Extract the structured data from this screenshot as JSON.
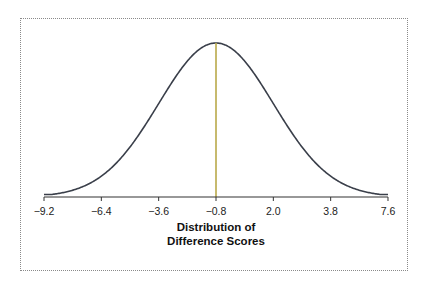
{
  "chart_data": {
    "type": "line",
    "title": "",
    "subtitle": "",
    "xlabel_line1": "Distribution of",
    "xlabel_line2": "Difference Scores",
    "ylabel": "",
    "x_ticks": [
      "−9.2",
      "−6.4",
      "−3.6",
      "−0.8",
      "2.0",
      "3.8",
      "7.6"
    ],
    "x_tick_values": [
      -9.2,
      -6.4,
      -3.6,
      -0.8,
      2.0,
      3.8,
      7.6
    ],
    "mean": -0.8,
    "mean_line_label": "-0.8",
    "sd_units": [
      -3,
      -2,
      -1,
      0,
      1,
      2,
      3
    ],
    "grid": false,
    "legend": "none",
    "series": [
      {
        "name": "Distribution of Difference Scores",
        "shape": "normal",
        "center": -0.8,
        "color": "#3a3f4a"
      }
    ],
    "colors": {
      "curve": "#3a3f4a",
      "mean_line": "#b9a94a",
      "axis": "#333333",
      "frame": "#8a8a8a"
    }
  }
}
